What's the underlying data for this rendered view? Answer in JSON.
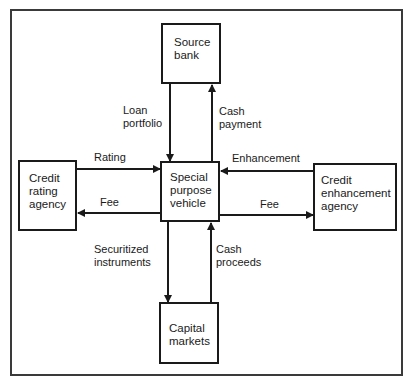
{
  "diagram": {
    "nodes": {
      "source_bank": "Source\nbank",
      "spv": "Special\npurpose\nvehicle",
      "credit_rating_agency": "Credit\nrating\nagency",
      "credit_enhancement_agency": "Credit\nenhancement\nagency",
      "capital_markets": "Capital\nmarkets"
    },
    "edges": {
      "loan_portfolio": "Loan\nportfolio",
      "cash_payment": "Cash\npayment",
      "rating": "Rating",
      "fee_left": "Fee",
      "enhancement": "Enhancement",
      "fee_right": "Fee",
      "securitized_instruments": "Securitized\ninstruments",
      "cash_proceeds": "Cash\nproceeds"
    }
  }
}
